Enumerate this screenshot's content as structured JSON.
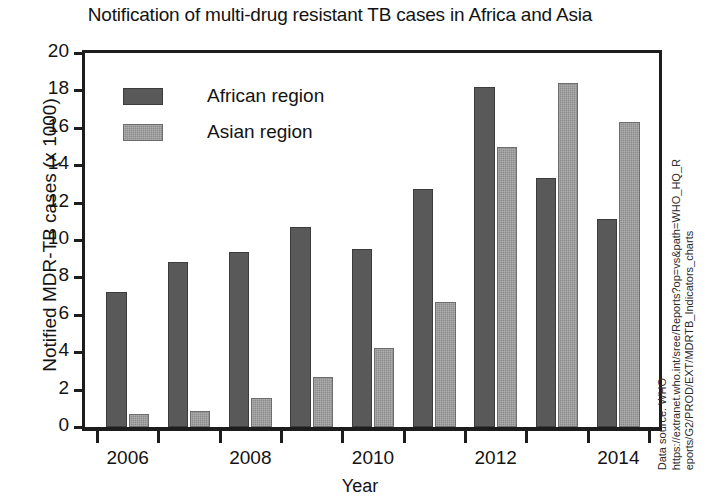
{
  "chart_data": {
    "type": "bar",
    "title": "Notification of multi-drug resistant TB cases in Africa and Asia",
    "xlabel": "Year",
    "ylabel": "Notified MDR-TB cases (x 1000)",
    "ylim": [
      0,
      20
    ],
    "ytick_step": 2,
    "yticks": [
      20,
      18,
      16,
      14,
      12,
      10,
      8,
      6,
      4,
      2,
      0
    ],
    "grid": false,
    "legend_position": "upper-left-inside",
    "categories": [
      "2006",
      "2007",
      "2008",
      "2009",
      "2010",
      "2011",
      "2012",
      "2013",
      "2014"
    ],
    "xtick_labels": [
      "2006",
      "2008",
      "2010",
      "2012",
      "2014"
    ],
    "series": [
      {
        "name": "African region",
        "color": "#595959",
        "values": [
          7.2,
          8.8,
          9.35,
          10.7,
          9.5,
          12.75,
          18.2,
          13.3,
          11.1
        ]
      },
      {
        "name": "Asian region",
        "color": "#8c8c8c",
        "values": [
          0.7,
          0.85,
          1.55,
          2.7,
          4.2,
          6.7,
          15.0,
          18.4,
          16.3
        ]
      }
    ],
    "annotations": {
      "source_line_1": "Data source: WHO",
      "source_line_2": "https://extranet.who.int/sree/Reports?op=vs&path=WHO_HQ_R",
      "source_line_3": "eports/G2/PROD/EXT/MDRTB_Indicators_charts"
    }
  }
}
